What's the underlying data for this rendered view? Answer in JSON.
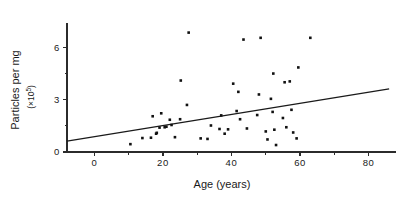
{
  "figure": {
    "name": "age-vs-particles-scatter",
    "background_color": "#ffffff",
    "ink_color": "#1a1a1a"
  },
  "chart_data": {
    "type": "scatter",
    "title": "",
    "subtitle": "",
    "xlabel": "Age (years)",
    "ylabel": "Particles per mg",
    "ylabel_units": "(×10⁵)",
    "ylabel_units_base": "(×10",
    "ylabel_units_exponent": "5",
    "ylabel_units_close": ")",
    "grid": false,
    "legend": null,
    "legend_position": "none",
    "xlim": [
      -8,
      88
    ],
    "ylim": [
      0,
      7.4
    ],
    "xticks": [
      0,
      20,
      40,
      60,
      80
    ],
    "xtick_labels": [
      "0",
      "20",
      "40",
      "60",
      "80"
    ],
    "x_minor_ticks": [
      10,
      30,
      50,
      70
    ],
    "yticks": [
      0,
      3,
      6
    ],
    "ytick_labels": [
      "0",
      "3",
      "6"
    ],
    "y_minor_ticks": [
      1.5,
      4.5
    ],
    "marker": "square",
    "marker_size_px": 2.6,
    "marker_color": "#111111",
    "points": [
      {
        "x": 10.5,
        "y": 0.45
      },
      {
        "x": 14.0,
        "y": 0.8
      },
      {
        "x": 16.5,
        "y": 0.82
      },
      {
        "x": 17.0,
        "y": 2.05
      },
      {
        "x": 18.0,
        "y": 1.05
      },
      {
        "x": 18.2,
        "y": 1.1
      },
      {
        "x": 19.0,
        "y": 1.4
      },
      {
        "x": 19.5,
        "y": 2.22
      },
      {
        "x": 20.5,
        "y": 1.42
      },
      {
        "x": 21.0,
        "y": 1.45
      },
      {
        "x": 22.0,
        "y": 1.85
      },
      {
        "x": 22.5,
        "y": 1.55
      },
      {
        "x": 23.5,
        "y": 0.85
      },
      {
        "x": 25.0,
        "y": 1.88
      },
      {
        "x": 25.2,
        "y": 4.1
      },
      {
        "x": 27.0,
        "y": 2.7
      },
      {
        "x": 27.5,
        "y": 6.85
      },
      {
        "x": 31.0,
        "y": 0.78
      },
      {
        "x": 33.0,
        "y": 0.75
      },
      {
        "x": 34.0,
        "y": 1.52
      },
      {
        "x": 36.5,
        "y": 1.32
      },
      {
        "x": 37.0,
        "y": 2.1
      },
      {
        "x": 38.0,
        "y": 1.05
      },
      {
        "x": 39.0,
        "y": 1.3
      },
      {
        "x": 40.5,
        "y": 3.92
      },
      {
        "x": 41.5,
        "y": 2.35
      },
      {
        "x": 42.0,
        "y": 3.45
      },
      {
        "x": 42.5,
        "y": 1.88
      },
      {
        "x": 43.5,
        "y": 6.45
      },
      {
        "x": 44.5,
        "y": 1.35
      },
      {
        "x": 47.5,
        "y": 2.12
      },
      {
        "x": 48.0,
        "y": 3.3
      },
      {
        "x": 48.5,
        "y": 6.55
      },
      {
        "x": 50.0,
        "y": 1.18
      },
      {
        "x": 50.5,
        "y": 0.72
      },
      {
        "x": 51.5,
        "y": 3.05
      },
      {
        "x": 52.0,
        "y": 2.3
      },
      {
        "x": 52.2,
        "y": 4.5
      },
      {
        "x": 52.5,
        "y": 1.28
      },
      {
        "x": 53.0,
        "y": 0.4
      },
      {
        "x": 55.0,
        "y": 1.95
      },
      {
        "x": 55.5,
        "y": 4.0
      },
      {
        "x": 56.0,
        "y": 1.42
      },
      {
        "x": 57.0,
        "y": 4.05
      },
      {
        "x": 57.5,
        "y": 2.42
      },
      {
        "x": 58.0,
        "y": 1.12
      },
      {
        "x": 59.0,
        "y": 0.78
      },
      {
        "x": 59.5,
        "y": 4.85
      },
      {
        "x": 63.0,
        "y": 6.55
      }
    ],
    "trend_line": {
      "name": "regression-line",
      "x_start": -8,
      "y_start": 0.62,
      "x_end": 86,
      "y_end": 3.62
    }
  }
}
